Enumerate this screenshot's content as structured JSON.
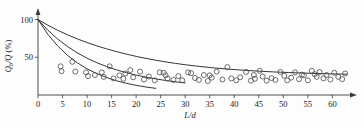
{
  "chart_data": {
    "type": "scatter",
    "title": "",
    "subtitle": "",
    "xlabel": "L/d",
    "ylabel": "Qb/Q (%)",
    "ylabel_parts": {
      "q": "Q",
      "sub": "b",
      "slash": "/Q",
      "unit": " (%)"
    },
    "xlim": [
      0,
      64
    ],
    "ylim": [
      0,
      110
    ],
    "xticks": [
      0,
      5,
      10,
      15,
      20,
      25,
      30,
      35,
      40,
      45,
      50,
      55,
      60
    ],
    "xtick_labels": [
      "0",
      "5",
      "10",
      "15",
      "20",
      "25",
      "30",
      "35",
      "40",
      "45",
      "50",
      "55",
      "60"
    ],
    "yticks": [
      50,
      100
    ],
    "ytick_labels": [
      "50",
      "100"
    ],
    "grid": false,
    "legend": "none",
    "axis_arrows": {
      "x": "right",
      "y": "up"
    },
    "series": [
      {
        "name": "upper-decay-curve",
        "type": "line",
        "style": "solid",
        "x": [
          0,
          2,
          4,
          6,
          8,
          10,
          12,
          14,
          16,
          18,
          20,
          22,
          24,
          26,
          28,
          30,
          33,
          36,
          39,
          42,
          45,
          48,
          51,
          54,
          57,
          60,
          63
        ],
        "y": [
          100,
          92.5,
          85.8,
          79.8,
          74.4,
          69.5,
          65.1,
          61.1,
          57.5,
          54.2,
          51.2,
          48.5,
          46.1,
          43.9,
          41.9,
          40.1,
          37.8,
          35.8,
          34.2,
          32.8,
          31.6,
          30.6,
          29.8,
          29.1,
          28.5,
          28.0,
          27.6
        ]
      },
      {
        "name": "middle-decay-curve",
        "type": "line",
        "style": "solid",
        "x": [
          0,
          2,
          4,
          6,
          8,
          10,
          12,
          14,
          16,
          18,
          20,
          22,
          24,
          26,
          28,
          30
        ],
        "y": [
          100,
          86.0,
          74.2,
          64.3,
          55.9,
          48.8,
          42.8,
          37.7,
          33.3,
          29.6,
          26.4,
          23.7,
          21.3,
          19.3,
          17.5,
          16.0
        ]
      },
      {
        "name": "lower-decay-curve",
        "type": "line",
        "style": "solid",
        "x": [
          0,
          2,
          4,
          6,
          8,
          10,
          12,
          14,
          16,
          18,
          20,
          22,
          24
        ],
        "y": [
          100,
          80.5,
          65.0,
          52.6,
          42.7,
          34.7,
          28.3,
          23.1,
          18.9,
          15.5,
          12.8,
          10.6,
          8.8
        ]
      },
      {
        "name": "measured-points",
        "type": "scatter",
        "marker": "open-circle",
        "points": [
          [
            4.6,
            38.0
          ],
          [
            7.0,
            44.0
          ],
          [
            7.6,
            31.0
          ],
          [
            9.8,
            30.0
          ],
          [
            10.2,
            25.0
          ],
          [
            11.6,
            26.5
          ],
          [
            13.4,
            24.0
          ],
          [
            14.6,
            38.0
          ],
          [
            15.4,
            22.0
          ],
          [
            16.6,
            26.0
          ],
          [
            17.4,
            21.5
          ],
          [
            18.8,
            33.0
          ],
          [
            19.4,
            23.5
          ],
          [
            20.8,
            31.0
          ],
          [
            21.6,
            20.5
          ],
          [
            22.6,
            24.5
          ],
          [
            23.8,
            19.5
          ],
          [
            24.8,
            30.0
          ],
          [
            25.6,
            29.5
          ],
          [
            26.4,
            22.0
          ],
          [
            27.6,
            20.0
          ],
          [
            28.6,
            25.0
          ],
          [
            29.4,
            19.5
          ],
          [
            30.6,
            30.0
          ],
          [
            31.2,
            29.0
          ],
          [
            32.0,
            22.5
          ],
          [
            32.8,
            20.0
          ],
          [
            33.8,
            26.5
          ],
          [
            34.6,
            18.5
          ],
          [
            35.4,
            23.0
          ],
          [
            36.4,
            31.0
          ],
          [
            37.6,
            20.5
          ],
          [
            38.6,
            37.0
          ],
          [
            39.4,
            22.0
          ],
          [
            40.4,
            19.5
          ],
          [
            41.2,
            23.5
          ],
          [
            42.4,
            30.5
          ],
          [
            43.4,
            19.0
          ],
          [
            44.2,
            21.5
          ],
          [
            45.2,
            32.0
          ],
          [
            45.8,
            24.5
          ],
          [
            46.6,
            19.0
          ],
          [
            47.6,
            22.5
          ],
          [
            48.4,
            20.0
          ],
          [
            49.4,
            30.5
          ],
          [
            50.2,
            25.5
          ],
          [
            50.8,
            19.5
          ],
          [
            51.6,
            23.0
          ],
          [
            52.4,
            30.0
          ],
          [
            53.2,
            21.0
          ],
          [
            54.2,
            26.0
          ],
          [
            55.0,
            19.5
          ],
          [
            55.8,
            32.0
          ],
          [
            56.4,
            27.5
          ],
          [
            56.8,
            24.0
          ],
          [
            57.4,
            30.5
          ],
          [
            58.2,
            22.0
          ],
          [
            58.8,
            26.5
          ],
          [
            59.6,
            20.5
          ],
          [
            60.4,
            29.5
          ],
          [
            61.2,
            24.0
          ],
          [
            62.0,
            21.0
          ],
          [
            62.6,
            28.5
          ],
          [
            4.8,
            31.5
          ],
          [
            13.0,
            30.0
          ],
          [
            17.8,
            28.5
          ],
          [
            26.0,
            26.0
          ],
          [
            35.0,
            26.0
          ],
          [
            44.0,
            26.5
          ],
          [
            53.8,
            27.0
          ]
        ]
      }
    ]
  }
}
